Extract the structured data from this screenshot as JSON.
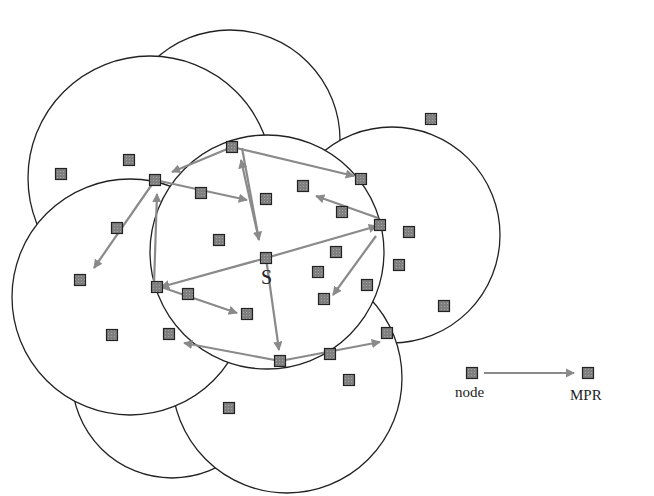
{
  "colors": {
    "circle": "#222222",
    "node_fill": "#7a7a7a",
    "node_stroke": "#222222",
    "arrow": "#8a8a8a",
    "arrow_dark": "#6e6e6e"
  },
  "source_label": "S",
  "legend": {
    "node_label": "node",
    "mpr_label": "MPR"
  },
  "circles": [
    {
      "cx": 230,
      "cy": 140,
      "r": 110
    },
    {
      "cx": 150,
      "cy": 178,
      "r": 122
    },
    {
      "cx": 392,
      "cy": 235,
      "r": 108
    },
    {
      "cx": 172,
      "cy": 378,
      "r": 100
    },
    {
      "cx": 287,
      "cy": 378,
      "r": 115
    },
    {
      "cx": 130,
      "cy": 297,
      "r": 118
    },
    {
      "cx": 267,
      "cy": 252,
      "r": 117
    }
  ],
  "nodes": [
    {
      "x": 61,
      "y": 174
    },
    {
      "x": 129,
      "y": 160
    },
    {
      "x": 155,
      "y": 180
    },
    {
      "x": 232,
      "y": 147
    },
    {
      "x": 201,
      "y": 193
    },
    {
      "x": 266,
      "y": 199
    },
    {
      "x": 303,
      "y": 186
    },
    {
      "x": 361,
      "y": 179
    },
    {
      "x": 342,
      "y": 212
    },
    {
      "x": 380,
      "y": 225
    },
    {
      "x": 431,
      "y": 119
    },
    {
      "x": 409,
      "y": 232
    },
    {
      "x": 117,
      "y": 228
    },
    {
      "x": 219,
      "y": 240
    },
    {
      "x": 266,
      "y": 258
    },
    {
      "x": 336,
      "y": 252
    },
    {
      "x": 318,
      "y": 272
    },
    {
      "x": 399,
      "y": 265
    },
    {
      "x": 80,
      "y": 280
    },
    {
      "x": 157,
      "y": 287
    },
    {
      "x": 188,
      "y": 294
    },
    {
      "x": 367,
      "y": 285
    },
    {
      "x": 324,
      "y": 299
    },
    {
      "x": 247,
      "y": 314
    },
    {
      "x": 444,
      "y": 306
    },
    {
      "x": 112,
      "y": 335
    },
    {
      "x": 169,
      "y": 334
    },
    {
      "x": 387,
      "y": 333
    },
    {
      "x": 280,
      "y": 361
    },
    {
      "x": 330,
      "y": 354
    },
    {
      "x": 349,
      "y": 380
    },
    {
      "x": 229,
      "y": 408
    },
    {
      "x": 472,
      "y": 373
    },
    {
      "x": 588,
      "y": 373
    }
  ],
  "arrows": [
    {
      "x1": 266,
      "y1": 258,
      "x2": 377,
      "y2": 226
    },
    {
      "x1": 266,
      "y1": 258,
      "x2": 161,
      "y2": 287
    },
    {
      "x1": 266,
      "y1": 258,
      "x2": 279,
      "y2": 350
    },
    {
      "x1": 242,
      "y1": 148,
      "x2": 259,
      "y2": 240
    },
    {
      "x1": 232,
      "y1": 147,
      "x2": 172,
      "y2": 172
    },
    {
      "x1": 232,
      "y1": 147,
      "x2": 354,
      "y2": 176
    },
    {
      "x1": 259,
      "y1": 240,
      "x2": 241,
      "y2": 160
    },
    {
      "x1": 155,
      "y1": 180,
      "x2": 247,
      "y2": 200
    },
    {
      "x1": 155,
      "y1": 180,
      "x2": 94,
      "y2": 268
    },
    {
      "x1": 154,
      "y1": 285,
      "x2": 157,
      "y2": 194
    },
    {
      "x1": 161,
      "y1": 287,
      "x2": 237,
      "y2": 313
    },
    {
      "x1": 378,
      "y1": 218,
      "x2": 316,
      "y2": 196
    },
    {
      "x1": 376,
      "y1": 236,
      "x2": 333,
      "y2": 295
    },
    {
      "x1": 280,
      "y1": 361,
      "x2": 184,
      "y2": 343
    },
    {
      "x1": 280,
      "y1": 361,
      "x2": 380,
      "y2": 342
    }
  ],
  "legend_arrow": {
    "x1": 484,
    "y1": 373,
    "x2": 574,
    "y2": 373
  }
}
